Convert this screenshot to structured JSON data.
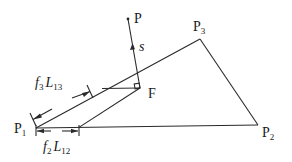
{
  "diagram": {
    "type": "geometry",
    "colors": {
      "stroke": "#2a2a2a",
      "text": "#1a1a1a",
      "background": "#ffffff"
    },
    "labels": {
      "p": "P",
      "p1": {
        "base": "P",
        "sub": "1"
      },
      "p2": {
        "base": "P",
        "sub": "2"
      },
      "p3": {
        "base": "P",
        "sub": "3"
      },
      "f": "F",
      "s": "s",
      "f3l13": {
        "f": "f",
        "fsub": "3",
        "l": "L",
        "lsub": "13"
      },
      "f2l12": {
        "f": "f",
        "fsub": "2",
        "l": "L",
        "lsub": "12"
      }
    },
    "points": {
      "P": [
        128,
        19
      ],
      "P1": [
        36,
        128
      ],
      "P2": [
        258,
        125
      ],
      "P3": [
        200,
        39
      ],
      "F": [
        140,
        88
      ]
    }
  }
}
